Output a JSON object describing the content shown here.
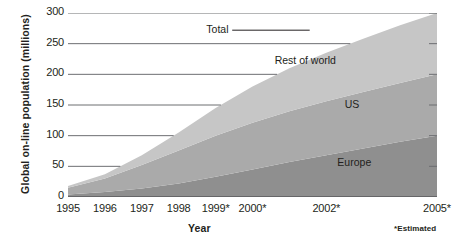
{
  "chart_data": {
    "type": "area",
    "stacked": true,
    "title": "",
    "xlabel": "Year",
    "ylabel": "Global on-line population (millions)",
    "footnote": "*Estimated",
    "xlim": [
      1995,
      2005
    ],
    "ylim": [
      0,
      300
    ],
    "grid": true,
    "legend_position": "in-chart annotations",
    "x": [
      1995,
      1996,
      1997,
      1998,
      1999,
      2000,
      2001,
      2002,
      2003,
      2004,
      2005
    ],
    "x_tick_labels": [
      "1995",
      "1996",
      "1997",
      "1998",
      "1999*",
      "2000*",
      "2002*",
      "2005*"
    ],
    "x_tick_values": [
      1995,
      1996,
      1997,
      1998,
      1999,
      2000,
      2002,
      2005
    ],
    "y_tick_labels": [
      "0",
      "50",
      "100",
      "150",
      "200",
      "250",
      "300"
    ],
    "y_tick_values": [
      0,
      50,
      100,
      150,
      200,
      250,
      300
    ],
    "series": [
      {
        "name": "Europe",
        "color": "#8f8f8f",
        "values": [
          4,
          8,
          14,
          22,
          33,
          45,
          57,
          68,
          79,
          90,
          100
        ]
      },
      {
        "name": "US",
        "color": "#aaaaaa",
        "values": [
          11,
          22,
          38,
          54,
          67,
          76,
          83,
          88,
          92,
          96,
          100
        ]
      },
      {
        "name": "Rest of world",
        "color": "#c6c6c6",
        "values": [
          3,
          7,
          16,
          29,
          45,
          59,
          70,
          79,
          87,
          94,
          100
        ]
      }
    ],
    "total": {
      "name": "Total",
      "values": [
        18,
        37,
        68,
        105,
        145,
        180,
        210,
        235,
        258,
        280,
        300
      ]
    }
  },
  "annotations": {
    "total": "Total",
    "rest_of_world": "Rest of world",
    "us": "US",
    "europe": "Europe"
  }
}
